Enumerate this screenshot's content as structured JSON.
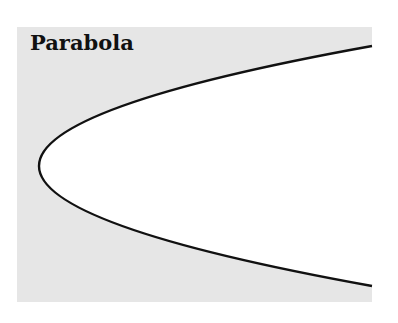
{
  "figure": {
    "title": "Parabola",
    "background_color": "#e6e6e6",
    "interior_color": "#ffffff",
    "curve_color": "#111111",
    "curve": {
      "type": "parabola",
      "orientation": "opens-right",
      "vertex": [
        39,
        166
      ],
      "endpoints": [
        [
          372,
          46
        ],
        [
          372,
          286
        ]
      ]
    }
  }
}
